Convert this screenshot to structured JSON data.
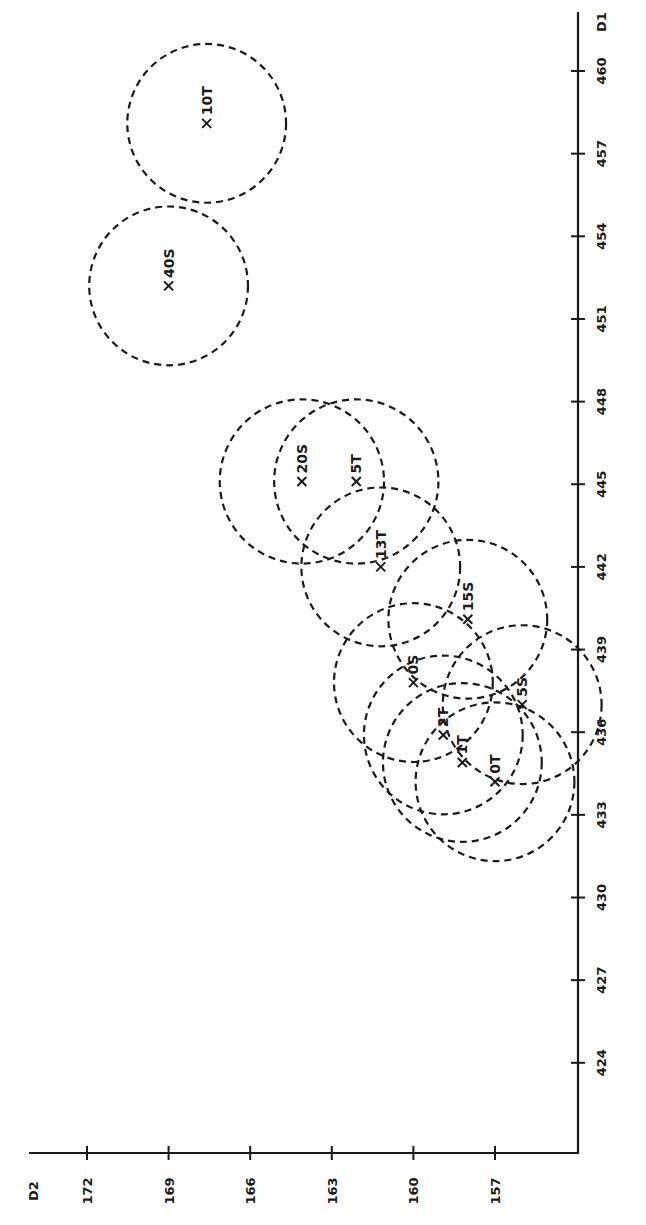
{
  "chart_data": {
    "type": "scatter",
    "title": "",
    "orientation_note": "figure rotated 90 degrees clockwise; D2 axis along bottom, D1 axis along right",
    "xlabel": "D2",
    "ylabel": "D1",
    "x_axis": {
      "label": "D2",
      "ticks": [
        172,
        169,
        166,
        163,
        160,
        157
      ],
      "range": [
        174,
        154
      ]
    },
    "y_axis": {
      "label": "D1",
      "ticks": [
        460,
        457,
        454,
        451,
        448,
        445,
        442,
        439,
        436,
        433,
        430,
        427,
        424
      ],
      "range": [
        421.5,
        462.5
      ]
    },
    "grid": false,
    "legend": null,
    "marker": "x",
    "circle_style": "dashed",
    "points": [
      {
        "label": "10T",
        "d2": 167.6,
        "d1": 458.1,
        "radius": 2.9
      },
      {
        "label": "40S",
        "d2": 169.0,
        "d1": 452.2,
        "radius": 2.9
      },
      {
        "label": "20S",
        "d2": 164.1,
        "d1": 445.1,
        "radius": 3.0
      },
      {
        "label": "5T",
        "d2": 162.1,
        "d1": 445.1,
        "radius": 3.0
      },
      {
        "label": "13T",
        "d2": 161.2,
        "d1": 442.0,
        "radius": 2.9
      },
      {
        "label": "15S",
        "d2": 158.0,
        "d1": 440.1,
        "radius": 2.9
      },
      {
        "label": "0S",
        "d2": 160.0,
        "d1": 437.8,
        "radius": 2.9
      },
      {
        "label": "2T",
        "d2": 158.9,
        "d1": 435.9,
        "radius": 2.9
      },
      {
        "label": "1T",
        "d2": 158.2,
        "d1": 434.9,
        "radius": 2.9
      },
      {
        "label": "0T",
        "d2": 157.0,
        "d1": 434.2,
        "radius": 2.9
      },
      {
        "label": "5S",
        "d2": 156.0,
        "d1": 437.0,
        "radius": 2.9
      }
    ]
  },
  "layout": {
    "px": {
      "bottom_axis_y": 1153,
      "right_axis_x": 578,
      "bottom_axis_x0": 29,
      "right_axis_y0": 12,
      "d2_ref_value": 172,
      "d2_ref_px": 87,
      "d2_px_per_unit": 27.2,
      "d1_ref_value": 460,
      "d1_ref_px": 71,
      "d1_px_per_unit": 27.55
    }
  }
}
